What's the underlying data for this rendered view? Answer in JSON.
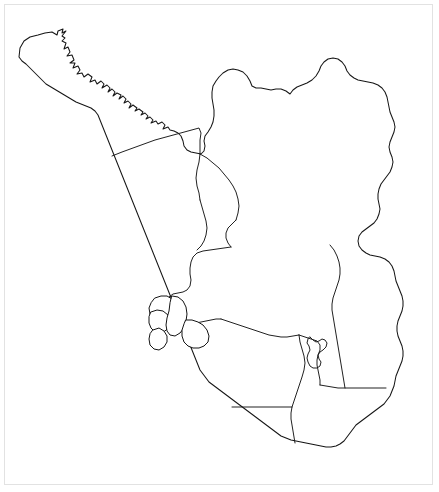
{
  "figure": {
    "title": "",
    "caption": "",
    "background_color": "#ffffff",
    "frame_color": "#e2e2e2",
    "width": 439,
    "height": 492
  },
  "map": {
    "type": "choropleth-locator",
    "outline_color": "#151515",
    "land_fill": "#ffffff",
    "highlight_core_color": "#4b4b4b",
    "highlight_halo_color": "#b9b9b9",
    "regions": [
      {
        "id": "north-west",
        "label": "",
        "highlighted": false
      },
      {
        "id": "north-central",
        "label": "",
        "highlighted": false
      },
      {
        "id": "north-east",
        "label": "",
        "highlighted": false
      },
      {
        "id": "central-west",
        "label": "",
        "highlighted": false
      },
      {
        "id": "central",
        "label": "",
        "highlighted": true
      },
      {
        "id": "central-east",
        "label": "",
        "highlighted": false
      },
      {
        "id": "south-west",
        "label": "",
        "highlighted": false
      },
      {
        "id": "south-central",
        "label": "",
        "highlighted": false
      },
      {
        "id": "south-east",
        "label": "",
        "highlighted": false
      },
      {
        "id": "enclave",
        "label": "",
        "highlighted": false
      }
    ],
    "islands": [
      {
        "id": "island-north",
        "label": ""
      },
      {
        "id": "island-mid",
        "label": ""
      },
      {
        "id": "island-south",
        "label": ""
      }
    ]
  }
}
